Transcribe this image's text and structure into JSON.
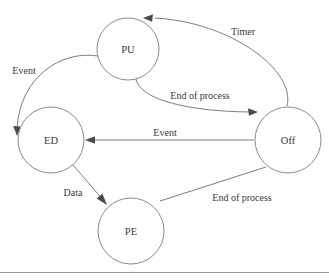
{
  "diagram": {
    "type": "state-transition-diagram",
    "background_color": "#fefefe",
    "node_stroke_color": "#8a8a8a",
    "edge_stroke_color": "#7d7d7d",
    "text_color": "#3a3a3a",
    "nodes": [
      {
        "id": "PU",
        "label": "PU",
        "cx": 128,
        "cy": 49,
        "r": 31
      },
      {
        "id": "ED",
        "label": "ED",
        "cx": 51,
        "cy": 140,
        "r": 33
      },
      {
        "id": "Off",
        "label": "Off",
        "cx": 288,
        "cy": 140,
        "r": 33
      },
      {
        "id": "PE",
        "label": "PE",
        "cx": 131,
        "cy": 231,
        "r": 33
      }
    ],
    "edges": [
      {
        "id": "off-to-pu",
        "from": "Off",
        "to": "PU",
        "label": "Timer",
        "label_x": 243,
        "label_y": 31,
        "path": "M 287 106 C 296 70 230 22 155 18",
        "arrow_at": [
          143,
          18
        ],
        "arrow_angle": 188
      },
      {
        "id": "pu-to-off",
        "from": "PU",
        "to": "Off",
        "label": "End of process",
        "label_x": 200,
        "label_y": 95,
        "path": "M 136 79 C 140 100 190 112 255 112",
        "arrow_at": [
          257,
          112
        ],
        "arrow_angle": 2
      },
      {
        "id": "pu-to-ed",
        "from": "PU",
        "to": "ED",
        "label": "Event",
        "label_x": 24,
        "label_y": 70,
        "path": "M 98 56 C 60 50 20 78 17 128",
        "arrow_at": [
          17,
          134
        ],
        "arrow_angle": 92
      },
      {
        "id": "off-to-ed",
        "from": "Off",
        "to": "ED",
        "label": "Event",
        "label_x": 165,
        "label_y": 132,
        "path": "M 254 140 L 88 140",
        "arrow_at": [
          85,
          140
        ],
        "arrow_angle": 180
      },
      {
        "id": "ed-to-pe",
        "from": "ED",
        "to": "PE",
        "label": "Data",
        "label_x": 73,
        "label_y": 192,
        "path": "M 73 165 L 104 201",
        "arrow_at": [
          106,
          204
        ],
        "arrow_angle": 49
      },
      {
        "id": "pe-to-off",
        "from": "PE",
        "to": "Off",
        "label": "End of process",
        "label_x": 242,
        "label_y": 197,
        "path": "M 160 201 L 266 167",
        "arrow_at": null,
        "arrow_angle": null
      }
    ],
    "bottom_rule_visible": true
  }
}
